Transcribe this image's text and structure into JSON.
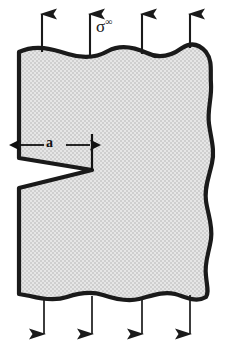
{
  "figure": {
    "type": "engineering-diagram",
    "background_color": "#ffffff",
    "body_fill_color": "#d9d9d9",
    "outline_color": "#1a1a1a",
    "arrow_color": "#1a1a1a",
    "labels": {
      "remote_stress": "σ",
      "remote_stress_superscript": "∞",
      "crack_length": "a"
    },
    "annotations": {
      "crack_length_dimension": {
        "label": "a",
        "from_x": 19,
        "to_x": 92,
        "y": 145
      },
      "crack_tip": {
        "x": 92,
        "y": 170
      }
    },
    "top_arrows": {
      "count": 4,
      "direction": "up",
      "x_positions": [
        42,
        90,
        142,
        190
      ],
      "tip_y": 12,
      "tail_y": 52
    },
    "bottom_arrows": {
      "count": 4,
      "direction": "down",
      "x_positions": [
        44,
        92,
        142,
        190
      ],
      "tip_y": 338,
      "tail_y": 298
    },
    "plate": {
      "left_edge_straight": true,
      "right_edge_wavy": true,
      "top_edge_wavy": true,
      "bottom_edge_wavy": true
    }
  }
}
